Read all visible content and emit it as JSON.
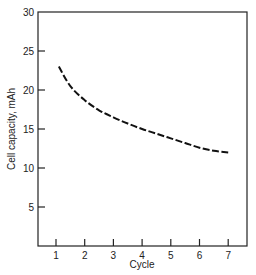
{
  "chart_data": {
    "type": "line",
    "title": "",
    "xlabel": "Cycle",
    "ylabel": "Cell capacity, mAh",
    "xlim": [
      0.4,
      7.7
    ],
    "ylim": [
      0,
      30
    ],
    "x_ticks": [
      "1",
      "2",
      "3",
      "4",
      "5",
      "6",
      "7"
    ],
    "y_ticks": [
      "5",
      "10",
      "15",
      "20",
      "25",
      "30"
    ],
    "grid": false,
    "legend": null,
    "series": [
      {
        "name": "Cell capacity",
        "style": "dashed",
        "x": [
          1.1,
          1.5,
          2,
          2.5,
          3,
          3.5,
          4,
          4.5,
          5,
          5.5,
          6,
          6.5,
          7
        ],
        "y": [
          23,
          20.5,
          18.7,
          17.4,
          16.5,
          15.7,
          15.0,
          14.4,
          13.8,
          13.2,
          12.6,
          12.2,
          12.0
        ]
      }
    ]
  }
}
